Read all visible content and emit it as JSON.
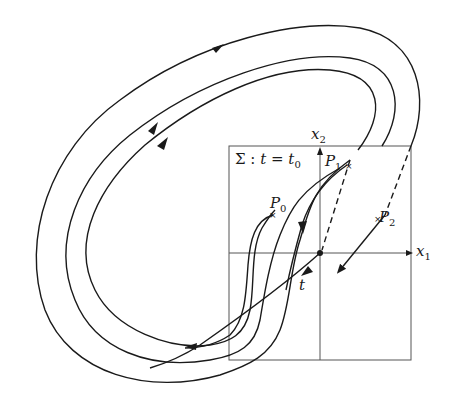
{
  "figure": {
    "type": "phase-portrait-poincare-section",
    "colors": {
      "stroke": "#1a1a1a",
      "box": "#555555",
      "background": "#ffffff"
    }
  },
  "labels": {
    "x2_axis": {
      "base": "x",
      "sub": "2"
    },
    "x1_axis": {
      "base": "x",
      "sub": "1"
    },
    "section": {
      "sigma": "Σ : ",
      "t": "t",
      "eq": " = ",
      "t0_base": "t",
      "t0_sub": "0"
    },
    "P0": {
      "base": "P",
      "sub": "0"
    },
    "P1": {
      "base": "P",
      "sub": "1"
    },
    "P2": {
      "base": "P",
      "sub": "2"
    },
    "t_axis": "t"
  },
  "points": [
    {
      "name": "P0",
      "marker": "×"
    },
    {
      "name": "P1",
      "marker": "×"
    },
    {
      "name": "P2",
      "marker": "×"
    },
    {
      "name": "origin",
      "marker": "●"
    }
  ]
}
